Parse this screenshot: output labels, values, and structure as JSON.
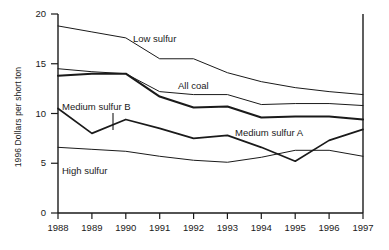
{
  "chart_data": {
    "type": "line",
    "title": "",
    "xlabel": "",
    "ylabel": "1996 Dollars per short ton",
    "x": [
      1988,
      1989,
      1990,
      1991,
      1992,
      1993,
      1994,
      1995,
      1996,
      1997
    ],
    "xlim": [
      1988,
      1997
    ],
    "ylim": [
      0,
      20
    ],
    "yticks": [
      0,
      5,
      10,
      15,
      20
    ],
    "xticks": [
      1988,
      1989,
      1990,
      1991,
      1992,
      1993,
      1994,
      1995,
      1996,
      1997
    ],
    "grid": false,
    "legend": "inline-annotations",
    "series": [
      {
        "name": "Low sulfur",
        "values": [
          18.8,
          18.2,
          17.6,
          15.5,
          15.5,
          14.1,
          13.2,
          12.6,
          12.2,
          11.9
        ]
      },
      {
        "name": "All coal",
        "values": [
          14.5,
          14.2,
          14.0,
          12.2,
          11.9,
          11.9,
          10.9,
          11.0,
          11.0,
          10.8
        ]
      },
      {
        "name": "Medium sulfur A",
        "values": [
          13.8,
          14.0,
          14.0,
          11.7,
          10.6,
          10.7,
          9.6,
          9.7,
          9.7,
          9.4
        ]
      },
      {
        "name": "Medium sulfur B",
        "values": [
          10.5,
          8.0,
          9.4,
          8.5,
          7.5,
          7.8,
          6.6,
          5.2,
          7.3,
          8.4
        ]
      },
      {
        "name": "High sulfur",
        "values": [
          6.6,
          6.4,
          6.2,
          5.7,
          5.3,
          5.1,
          5.6,
          6.3,
          6.3,
          5.7
        ]
      }
    ]
  },
  "axes": {
    "y_tick_labels": [
      "20",
      "15",
      "10",
      "5",
      "0"
    ],
    "x_tick_labels": [
      "1988",
      "1989",
      "1990",
      "1991",
      "1992",
      "1993",
      "1994",
      "1995",
      "1996",
      "1997"
    ],
    "y_axis_title": "1996 Dollars per short ton"
  },
  "annotations": {
    "low_sulfur": "Low sulfur",
    "all_coal": "All coal",
    "medium_sulfur_b": "Medium sulfur B",
    "medium_sulfur_a": "Medium sulfur A",
    "high_sulfur": "High sulfur"
  }
}
